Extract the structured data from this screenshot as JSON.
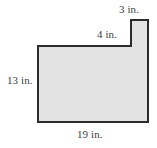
{
  "figure": {
    "name": "L-shaped polygon with step",
    "unit": "in.",
    "fill_color": "#e3e3e3",
    "stroke_color": "#2b2b2b",
    "background_color": "#ffffff",
    "labels": {
      "top_right": "3 in.",
      "step": "4 in.",
      "left": "13 in.",
      "bottom": "19 in."
    },
    "dimensions": [
      {
        "side": "top-right-tab-width",
        "value": 3,
        "unit": "in.",
        "text": "3 in."
      },
      {
        "side": "step-ledge-width",
        "value": 4,
        "unit": "in.",
        "text": "4 in."
      },
      {
        "side": "left-height",
        "value": 13,
        "unit": "in.",
        "text": "13 in."
      },
      {
        "side": "bottom-width",
        "value": 19,
        "unit": "in.",
        "text": "19 in."
      }
    ],
    "outline_points": "38,46 131,46 131,20 148,20 148,122 38,122"
  }
}
